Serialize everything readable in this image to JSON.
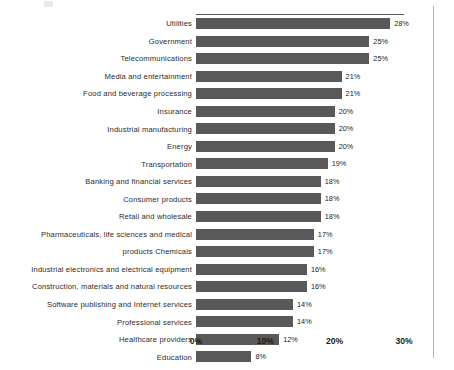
{
  "chart_data": {
    "type": "bar",
    "orientation": "horizontal",
    "title": "",
    "subtitle": "",
    "xlabel": "",
    "ylabel": "",
    "xlim": [
      0,
      30
    ],
    "xtick_labels": [
      "0%",
      "10%",
      "20%",
      "30%"
    ],
    "xticks": [
      0,
      10,
      20,
      30
    ],
    "grid": false,
    "legend": null,
    "bar_color": "#595959",
    "value_label_suffix": "%",
    "categories": [
      "Utilities",
      "Government",
      "Telecommunications",
      "Media and entertainment",
      "Food and beverage processing",
      "Insurance",
      "Industrial manufacturing",
      "Energy",
      "Transportation",
      "Banking and financial services",
      "Consumer products",
      "Retail and wholesale",
      "Pharmaceuticals, life sciences and medical",
      "products Chemicals",
      "Industrial electronics and electrical equipment",
      "Construction, materials and natural resources",
      "Software publishing and Internet services",
      "Professional services",
      "Healthcare providers",
      "Education"
    ],
    "values": [
      28,
      25,
      25,
      21,
      21,
      20,
      20,
      20,
      19,
      18,
      18,
      18,
      17,
      17,
      16,
      16,
      14,
      14,
      12,
      8
    ],
    "value_labels": [
      "28%",
      "25%",
      "25%",
      "21%",
      "21%",
      "20%",
      "20%",
      "20%",
      "19%",
      "18%",
      "18%",
      "18%",
      "17%",
      "17%",
      "16%",
      "16%",
      "14%",
      "14%",
      "12%",
      "8%"
    ]
  }
}
